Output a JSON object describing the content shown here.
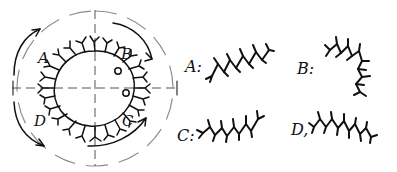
{
  "figure": {
    "title": "",
    "background_color": "#ffffff",
    "ink_color": "#111111",
    "axis_color": "#555555",
    "outer_circle_color": "#8b8b8b",
    "style": "hand-drawn pen sketch"
  },
  "diagram": {
    "name": "spiky-circle-quadrant-diagram",
    "center": {
      "x": 95,
      "y": 88
    },
    "inner_circle_radius": 38,
    "outer_circle_radius": 78,
    "inner_circle_description": "closed loop covered with outward-pointing branched spikes",
    "outer_circle_description": "dashed reference circle",
    "axes": {
      "horizontal": {
        "x1": 12,
        "y1": 88,
        "x2": 178,
        "y2": 88,
        "dashed": true
      },
      "vertical": {
        "x1": 95,
        "y1": 10,
        "x2": 95,
        "y2": 166,
        "dashed": true
      },
      "end_ticks": true
    },
    "quadrants": [
      {
        "id": "A",
        "label": "A",
        "position": "top-left",
        "label_x": 44,
        "label_y": 58,
        "arrow": "counter-clockwise, pointing up-right"
      },
      {
        "id": "B",
        "label": "B",
        "position": "top-right",
        "label_x": 126,
        "label_y": 55,
        "arrow": "clockwise, pointing down-right"
      },
      {
        "id": "C",
        "label": "C",
        "position": "bottom-right",
        "label_x": 128,
        "label_y": 122,
        "arrow": "counter-clockwise, pointing up-right"
      },
      {
        "id": "D",
        "label": "D",
        "position": "bottom-left",
        "label_x": 40,
        "label_y": 122,
        "arrow": "clockwise, pointing down-right"
      }
    ]
  },
  "legend": {
    "name": "chain-structure-legend",
    "items": [
      {
        "id": "A",
        "label": "A:",
        "label_x": 186,
        "label_y": 70,
        "chain_description": "zigzag chain ascending to the right with short branch ticks",
        "direction": "up-right",
        "segments": 9
      },
      {
        "id": "B",
        "label": "B:",
        "label_x": 298,
        "label_y": 72,
        "chain_description": "zigzag chain curving from upper-left down and around to the right, hooked end",
        "direction": "curved / hooked",
        "segments": 9
      },
      {
        "id": "C",
        "label": "C:",
        "label_x": 178,
        "label_y": 138,
        "chain_description": "zigzag chain ascending to the right with branch ticks",
        "direction": "up-right",
        "segments": 9
      },
      {
        "id": "D",
        "label": "D,",
        "label_x": 292,
        "label_y": 132,
        "chain_description": "zigzag chain descending to the right with branch ticks",
        "direction": "down-right",
        "segments": 10
      }
    ]
  }
}
